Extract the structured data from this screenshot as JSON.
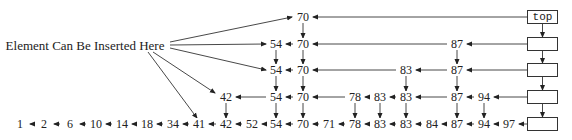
{
  "diagram": {
    "insert_label": "Element Can Be Inserted Here",
    "head_label": "top",
    "levels": [
      {
        "level": 4,
        "nodes": [
          "70"
        ]
      },
      {
        "level": 3,
        "nodes": [
          "54",
          "70",
          "87"
        ]
      },
      {
        "level": 2,
        "nodes": [
          "54",
          "70",
          "83",
          "87"
        ]
      },
      {
        "level": 1,
        "nodes": [
          "42",
          "54",
          "70",
          "78",
          "83",
          "83",
          "87",
          "94"
        ]
      },
      {
        "level": 0,
        "nodes": [
          "1",
          "2",
          "6",
          "10",
          "14",
          "18",
          "34",
          "41",
          "42",
          "52",
          "54",
          "70",
          "71",
          "78",
          "83",
          "83",
          "84",
          "87",
          "94",
          "97"
        ]
      }
    ]
  }
}
